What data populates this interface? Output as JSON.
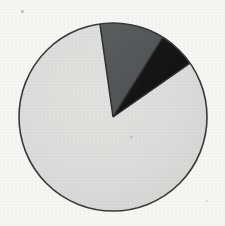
{
  "chart_data": {
    "type": "pie",
    "title": "",
    "subtitle": "",
    "xlabel": "",
    "ylabel": "",
    "grid": false,
    "legend": "none",
    "labels_shown": false,
    "categories": [
      "Slice 1",
      "Slice 2",
      "Slice 3"
    ],
    "values": [
      82.5,
      11.1,
      6.4
    ],
    "units": "percent",
    "total": 100,
    "start_angle_deg": -98,
    "direction": "clockwise",
    "slices": [
      {
        "name": "Slice 1",
        "value": 82.5,
        "color": "#dedede",
        "start_angle_deg": 55,
        "end_angle_deg": 352,
        "sweep_deg": 297
      },
      {
        "name": "Slice 2",
        "value": 11.1,
        "color": "#55595a",
        "start_angle_deg": 352,
        "end_angle_deg": 32,
        "sweep_deg": 40
      },
      {
        "name": "Slice 3",
        "value": 6.4,
        "color": "#151515",
        "start_angle_deg": 32,
        "end_angle_deg": 55,
        "sweep_deg": 23
      }
    ],
    "geometry": {
      "center_x": 113,
      "center_y": 117,
      "radius": 94,
      "outline_color": "#3a3a3a",
      "outline_width": 1.6
    }
  },
  "canvas": {
    "background_color": "#f8f8f6",
    "width": 225,
    "height": 226
  }
}
